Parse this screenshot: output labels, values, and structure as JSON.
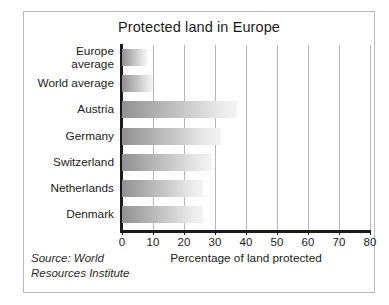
{
  "chart_data": {
    "type": "bar",
    "orientation": "horizontal",
    "title": "Protected land in Europe",
    "xlabel": "Percentage of land protected",
    "ylabel": "",
    "categories": [
      "Europe\naverage",
      "World average",
      "Austria",
      "Germany",
      "Switzerland",
      "Netherlands",
      "Denmark"
    ],
    "values": [
      8,
      10,
      37,
      32,
      29,
      26,
      26
    ],
    "xlim": [
      0,
      80
    ],
    "xticks": [
      0,
      10,
      20,
      30,
      40,
      50,
      60,
      70,
      80
    ],
    "xtick_labels": [
      "0",
      "10",
      "20",
      "30",
      "40",
      "50",
      "60",
      "70",
      "80"
    ],
    "grid": "vertical",
    "legend": null,
    "bar_fill": "gradient-gray-left-to-white-right",
    "colors": {
      "bar_start": "#919191",
      "bar_end": "#f4f4f4",
      "axis": "#1a1a1a",
      "gridline": "#b6b6b6",
      "frame": "#b9b9b9",
      "text": "#1b1b1b",
      "background": "#ffffff"
    },
    "annotations": [
      {
        "name": "source-note",
        "text": "Source: World\nResources Institute",
        "style": "italic",
        "position": "bottom-left"
      }
    ]
  }
}
